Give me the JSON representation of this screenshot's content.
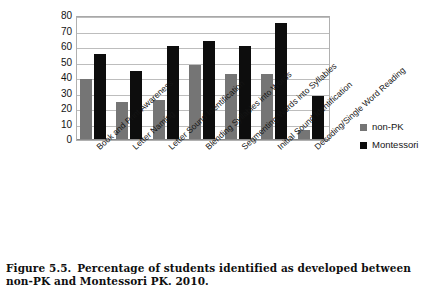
{
  "caption": {
    "figure_number": "Figure 5.5.",
    "text": "Percentage of students identified as developed between non-PK and Montessori PK. 2010."
  },
  "legend": {
    "position": "right",
    "items": [
      {
        "label": "non-PK",
        "color": "#757575"
      },
      {
        "label": "Montessori",
        "color": "#0d0d0d"
      }
    ]
  },
  "axis": {
    "y_ticks": [
      "0",
      "10",
      "20",
      "30",
      "40",
      "50",
      "60",
      "70",
      "80"
    ]
  },
  "chart_data": {
    "type": "bar",
    "title": "",
    "xlabel": "",
    "ylabel": "",
    "ylim": [
      0,
      80
    ],
    "ytick_step": 10,
    "grid": true,
    "legend_position": "right",
    "categories": [
      "Book and Print Awareness",
      "Letter Naming",
      "Letter Sound Identification",
      "Blending Syllables into Words",
      "Segmenting Words into Syllables",
      "Initial Sound Identification",
      "Decoding/Single Word Reading"
    ],
    "series": [
      {
        "name": "non-PK",
        "color": "#757575",
        "values": [
          39,
          24,
          25,
          48,
          42,
          42,
          6
        ]
      },
      {
        "name": "Montessori",
        "color": "#0d0d0d",
        "values": [
          55,
          44,
          60,
          63,
          60,
          75,
          28
        ]
      }
    ]
  }
}
